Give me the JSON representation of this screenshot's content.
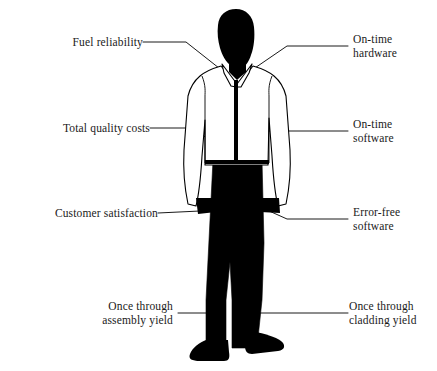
{
  "diagram": {
    "colors": {
      "figure_fill": "#000000",
      "shirt_fill": "#ffffff",
      "outline": "#000000",
      "leader_line": "#000000",
      "background": "#ffffff",
      "text": "#1a1a1a"
    },
    "callouts": [
      {
        "id": "fuel-reliability",
        "label": "Fuel reliability",
        "side": "left",
        "lines": [
          "Fuel reliability"
        ],
        "points_to": "head-neck-collar"
      },
      {
        "id": "total-quality-costs",
        "label": "Total quality costs",
        "side": "left",
        "lines": [
          "Total quality costs"
        ],
        "points_to": "left-chest-torso"
      },
      {
        "id": "customer-satisfaction",
        "label": "Customer satisfaction",
        "side": "left",
        "lines": [
          "Customer satisfaction"
        ],
        "points_to": "left-hand-waist"
      },
      {
        "id": "once-through-assembly-yield",
        "label": "Once through assembly yield",
        "side": "left",
        "lines": [
          "Once through",
          "assembly yield"
        ],
        "points_to": "left-leg"
      },
      {
        "id": "on-time-hardware",
        "label": "On-time hardware",
        "side": "right",
        "lines": [
          "On-time",
          "hardware"
        ],
        "points_to": "right-shoulder-collar"
      },
      {
        "id": "on-time-software",
        "label": "On-time software",
        "side": "right",
        "lines": [
          "On-time",
          "software"
        ],
        "points_to": "right-arm"
      },
      {
        "id": "error-free-software",
        "label": "Error-free software",
        "side": "right",
        "lines": [
          "Error-free",
          "software"
        ],
        "points_to": "right-hand-waist"
      },
      {
        "id": "once-through-cladding-yield",
        "label": "Once through cladding yield",
        "side": "right",
        "lines": [
          "Once through",
          "cladding yield"
        ],
        "points_to": "right-leg"
      }
    ]
  }
}
